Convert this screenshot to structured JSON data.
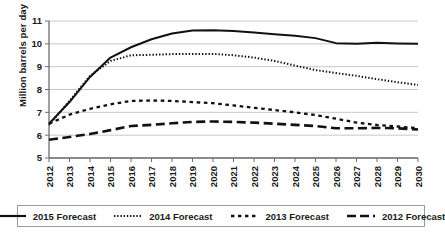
{
  "chart_data": {
    "type": "line",
    "title": "",
    "xlabel": "",
    "ylabel": "Million barrels per day",
    "xlim": [
      2012,
      2030
    ],
    "ylim": [
      5,
      11
    ],
    "yticks": [
      5,
      6,
      7,
      8,
      9,
      10,
      11
    ],
    "grid": true,
    "legend_position": "bottom",
    "categories": [
      2012,
      2013,
      2014,
      2015,
      2016,
      2017,
      2018,
      2019,
      2020,
      2021,
      2022,
      2023,
      2024,
      2025,
      2026,
      2027,
      2028,
      2029,
      2030
    ],
    "x_tick_labels": [
      "2012",
      "2013",
      "2014",
      "2015",
      "2016",
      "2017",
      "2018",
      "2019",
      "2020",
      "2021",
      "2022",
      "2023",
      "2024",
      "2025",
      "2026",
      "2027",
      "2028",
      "2029",
      "2030"
    ],
    "series": [
      {
        "name": "2015 Forecast",
        "style": "solid",
        "color": "#111111",
        "values": [
          6.5,
          7.45,
          8.55,
          9.4,
          9.85,
          10.2,
          10.45,
          10.58,
          10.6,
          10.56,
          10.5,
          10.42,
          10.35,
          10.25,
          10.03,
          10.0,
          10.05,
          10.02,
          10.0
        ]
      },
      {
        "name": "2014 Forecast",
        "style": "dotted",
        "color": "#111111",
        "values": [
          6.45,
          7.5,
          8.6,
          9.25,
          9.5,
          9.52,
          9.55,
          9.56,
          9.56,
          9.5,
          9.4,
          9.25,
          9.05,
          8.85,
          8.72,
          8.6,
          8.45,
          8.32,
          8.2
        ]
      },
      {
        "name": "2013 Forecast",
        "style": "dashed",
        "color": "#111111",
        "values": [
          6.5,
          6.9,
          7.15,
          7.35,
          7.5,
          7.52,
          7.5,
          7.45,
          7.4,
          7.3,
          7.2,
          7.1,
          7.0,
          6.88,
          6.72,
          6.55,
          6.45,
          6.38,
          6.3
        ]
      },
      {
        "name": "2012 Forecast",
        "style": "longdash",
        "color": "#111111",
        "values": [
          5.8,
          5.92,
          6.05,
          6.22,
          6.4,
          6.45,
          6.52,
          6.58,
          6.6,
          6.58,
          6.55,
          6.5,
          6.45,
          6.4,
          6.3,
          6.3,
          6.32,
          6.3,
          6.25
        ]
      }
    ]
  },
  "legend": {
    "items": [
      {
        "label": "2015 Forecast",
        "style": "solid"
      },
      {
        "label": "2014 Forecast",
        "style": "dotted"
      },
      {
        "label": "2013 Forecast",
        "style": "dashed"
      },
      {
        "label": "2012 Forecast",
        "style": "longdash"
      }
    ]
  },
  "axis": {
    "y_title": "Million barrels per day"
  },
  "colors": {
    "line": "#111111",
    "grid": "#b9b9b9",
    "axis": "#6d6d6d",
    "legend_border": "#9a9a9a"
  }
}
